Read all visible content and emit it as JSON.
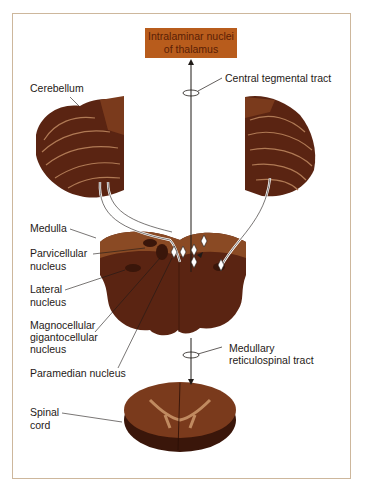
{
  "figure": {
    "title_box": {
      "line1": "Intralaminar nuclei",
      "line2": "of thalamus"
    },
    "labels": {
      "central_tegmental_tract": "Central tegmental tract",
      "cerebellum": "Cerebellum",
      "medulla": "Medulla",
      "parvicellular_1": "Parvicellular",
      "parvicellular_2": "nucleus",
      "lateral_1": "Lateral",
      "lateral_2": "nucleus",
      "magno_1": "Magnocellular",
      "magno_2": "gigantocellular",
      "magno_3": "nucleus",
      "paramedian": "Paramedian nucleus",
      "medullary_1": "Medullary",
      "medullary_2": "reticulospinal tract",
      "spinal_1": "Spinal",
      "spinal_2": "cord"
    },
    "colors": {
      "title_box_fill": "#b85c1c",
      "tissue_dark": "#5a2412",
      "tissue_mid": "#7a3a1c",
      "tissue_light": "#a86a40",
      "frame_border": "#cdb79c"
    }
  }
}
